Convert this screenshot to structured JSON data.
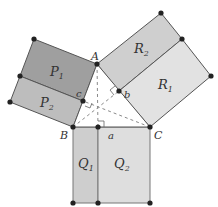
{
  "diagram": {
    "colors": {
      "P1": "#9f9f9f",
      "P2": "#bdbdbd",
      "R2": "#cfcfcf",
      "R1": "#e2e2e2",
      "Q1": "#cecece",
      "Q2": "#dedede",
      "stroke": "#555555",
      "point": "#222222",
      "dash": "#8a8a8a"
    },
    "points": {
      "A": {
        "label": "A",
        "x": 97,
        "y": 64
      },
      "B": {
        "label": "B",
        "x": 73,
        "y": 127
      },
      "C": {
        "label": "C",
        "x": 150,
        "y": 127
      }
    },
    "feet": {
      "a": {
        "label": "a",
        "x": 98,
        "y": 127
      },
      "b": {
        "label": "b",
        "x": 119,
        "y": 91
      },
      "c": {
        "label": "c",
        "x": 83,
        "y": 101
      }
    },
    "regions": {
      "P1": {
        "label": "P",
        "sub": "1"
      },
      "P2": {
        "label": "P",
        "sub": "2"
      },
      "R1": {
        "label": "R",
        "sub": "1"
      },
      "R2": {
        "label": "R",
        "sub": "2"
      },
      "Q1": {
        "label": "Q",
        "sub": "1"
      },
      "Q2": {
        "label": "Q",
        "sub": "2"
      }
    }
  }
}
